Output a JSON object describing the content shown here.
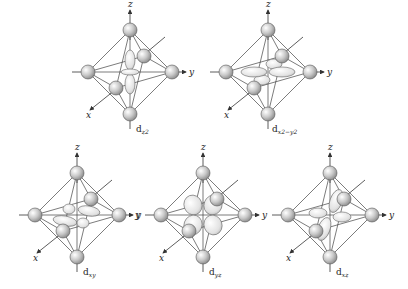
{
  "figure": {
    "axis_labels": {
      "x": "x",
      "y": "y",
      "z": "z"
    },
    "colors": {
      "ligand": "#bdbdbd",
      "lobe": "#e6e6e6",
      "line": "#444444"
    },
    "panels": [
      {
        "id": "dz2",
        "label_main": "d",
        "label_sub": "z2",
        "label_display": "d_z²",
        "row": 1,
        "cx": 130,
        "cy": 72
      },
      {
        "id": "dx2-y2",
        "label_main": "d",
        "label_sub": "x2−y2",
        "label_display": "d_x²−y²",
        "row": 1,
        "cx": 268,
        "cy": 72
      },
      {
        "id": "dxy",
        "label_main": "d",
        "label_sub": "xy",
        "label_display": "d_xy",
        "row": 2,
        "cx": 77,
        "cy": 215
      },
      {
        "id": "dyz",
        "label_main": "d",
        "label_sub": "yz",
        "label_display": "d_yz",
        "row": 2,
        "cx": 203,
        "cy": 215
      },
      {
        "id": "dxz",
        "label_main": "d",
        "label_sub": "xz",
        "label_display": "d_xz",
        "row": 2,
        "cx": 330,
        "cy": 215
      }
    ]
  }
}
